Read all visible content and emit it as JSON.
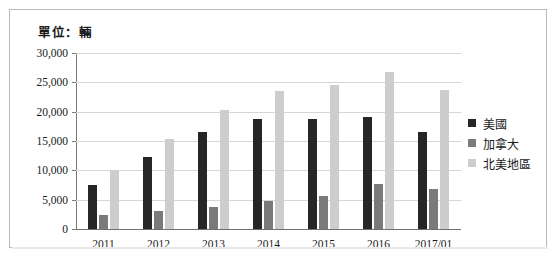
{
  "unit_label": "單位：輛",
  "chart_data": {
    "type": "bar",
    "title": "單位：輛",
    "xlabel": "",
    "ylabel": "",
    "ylim": [
      0,
      30000
    ],
    "ytick_labels": [
      "30,000",
      "25,000",
      "20,000",
      "15,000",
      "10,000",
      "5,000",
      "0"
    ],
    "ytick_values": [
      30000,
      25000,
      20000,
      15000,
      10000,
      5000,
      0
    ],
    "grid": true,
    "legend_position": "right",
    "categories": [
      "2011",
      "2012",
      "2013",
      "2014",
      "2015",
      "2016",
      "2017/01"
    ],
    "series": [
      {
        "name": "美國",
        "color": "#262626",
        "values": [
          7500,
          12300,
          16500,
          18700,
          18800,
          19100,
          16600
        ]
      },
      {
        "name": "加拿大",
        "color": "#7a7a7a",
        "values": [
          2400,
          3000,
          3800,
          4800,
          5600,
          7600,
          6900
        ]
      },
      {
        "name": "北美地區",
        "color": "#cdcdcd",
        "values": [
          10000,
          15400,
          20300,
          23500,
          24600,
          26800,
          23700
        ]
      }
    ]
  }
}
